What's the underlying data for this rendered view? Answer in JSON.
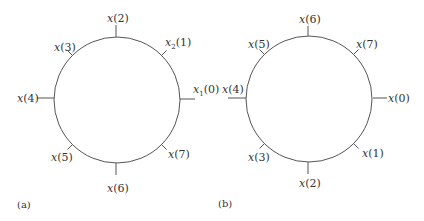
{
  "figure": {
    "panels": [
      {
        "id": "a",
        "panel_label": "(a)",
        "center": [
          117,
          100
        ],
        "radius": 63,
        "nodes": [
          {
            "angle_deg": 0,
            "var": "x",
            "sub": "1",
            "arg": "(0)",
            "tick": 13
          },
          {
            "angle_deg": 45,
            "var": "x",
            "sub": "2",
            "arg": "(1)",
            "tick": 7
          },
          {
            "angle_deg": 90,
            "var": "x",
            "sub": "",
            "arg": "(2)",
            "tick": 12
          },
          {
            "angle_deg": 135,
            "var": "x",
            "sub": "",
            "arg": "(3)",
            "tick": 7
          },
          {
            "angle_deg": 180,
            "var": "x",
            "sub": "",
            "arg": "(4)",
            "tick": 17
          },
          {
            "angle_deg": 225,
            "var": "x",
            "sub": "",
            "arg": "(5)",
            "tick": 7
          },
          {
            "angle_deg": 270,
            "var": "x",
            "sub": "",
            "arg": "(6)",
            "tick": 12
          },
          {
            "angle_deg": 315,
            "var": "x",
            "sub": "",
            "arg": "(7)",
            "tick": 7
          }
        ]
      },
      {
        "id": "b",
        "panel_label": "(b)",
        "center": [
          309,
          99
        ],
        "radius": 63,
        "nodes": [
          {
            "angle_deg": 0,
            "var": "x",
            "sub": "",
            "arg": "(0)",
            "tick": 14
          },
          {
            "angle_deg": 315,
            "var": "x",
            "sub": "",
            "arg": "(1)",
            "tick": 7
          },
          {
            "angle_deg": 270,
            "var": "x",
            "sub": "",
            "arg": "(2)",
            "tick": 12
          },
          {
            "angle_deg": 225,
            "var": "x",
            "sub": "",
            "arg": "(3)",
            "tick": 7
          },
          {
            "angle_deg": 180,
            "var": "x",
            "sub": "",
            "arg": "(4)",
            "tick": 18
          },
          {
            "angle_deg": 135,
            "var": "x",
            "sub": "",
            "arg": "(5)",
            "tick": 7
          },
          {
            "angle_deg": 90,
            "var": "x",
            "sub": "",
            "arg": "(6)",
            "tick": 10
          },
          {
            "angle_deg": 45,
            "var": "x",
            "sub": "",
            "arg": "(7)",
            "tick": 7
          }
        ]
      }
    ],
    "colors": {
      "stroke": "#555555",
      "text": "#333333",
      "background": "#ffffff"
    }
  }
}
